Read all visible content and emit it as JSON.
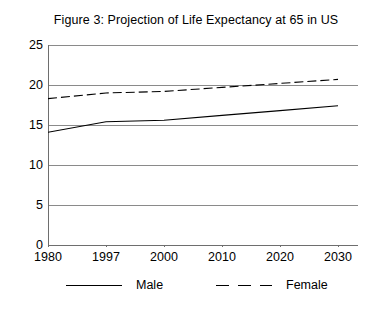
{
  "figure": {
    "title": "Figure 3:  Projection of Life Expectancy at 65 in US"
  },
  "axes": {
    "y_ticks": [
      "25",
      "20",
      "15",
      "10",
      "5",
      "0"
    ],
    "x_ticks": [
      "1980",
      "1997",
      "2000",
      "2010",
      "2020",
      "2030"
    ]
  },
  "legend": {
    "male_label": "Male",
    "female_label": "Female"
  },
  "colors": {
    "line": "#000000",
    "grid": "#808080",
    "axis": "#808080",
    "background": "#ffffff"
  },
  "chart_data": {
    "type": "line",
    "title": "Figure 3:  Projection of Life Expectancy at 65 in US",
    "xlabel": "",
    "ylabel": "",
    "x": [
      "1980",
      "1997",
      "2000",
      "2010",
      "2020",
      "2030"
    ],
    "categorical_x": true,
    "ylim": [
      0,
      25
    ],
    "yticks": [
      0,
      5,
      10,
      15,
      20,
      25
    ],
    "grid": "horizontal",
    "legend_position": "below",
    "series": [
      {
        "name": "Male",
        "style": "solid",
        "values": [
          14.1,
          15.4,
          15.6,
          16.2,
          16.8,
          17.4
        ]
      },
      {
        "name": "Female",
        "style": "dashed",
        "values": [
          18.3,
          19.0,
          19.2,
          19.7,
          20.2,
          20.7
        ]
      }
    ]
  }
}
